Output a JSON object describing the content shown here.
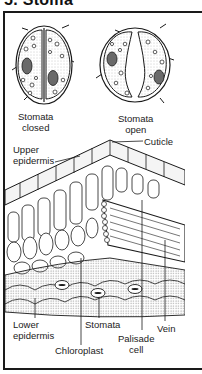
{
  "title": "5. Stoma",
  "labels": {
    "stomata_closed_line1": "Stomata",
    "stomata_closed_line2": "closed",
    "stomata_open_line1": "Stomata",
    "stomata_open_line2": "open",
    "upper_epidermis_line1": "Upper",
    "upper_epidermis_line2": "epidermis",
    "cuticle": "Cuticle",
    "lower_epidermis_line1": "Lower",
    "lower_epidermis_line2": "epidermis",
    "chloroplast": "Chloroplast",
    "stomata": "Stomata",
    "palisade_line1": "Palisade",
    "palisade_line2": "cell",
    "vein": "Vein"
  },
  "colors": {
    "ink": "#1a1a1a",
    "stipple": "#8a8a8a",
    "nucleus": "#6a6a6a",
    "background": "#ffffff"
  }
}
